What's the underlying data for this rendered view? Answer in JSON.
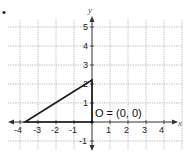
{
  "figure": {
    "bullet": "•",
    "x_axis_label": "x",
    "y_axis_label": "y",
    "x_ticks": [
      "-4",
      "-3",
      "-2",
      "-1",
      "1",
      "2",
      "3",
      "4"
    ],
    "y_ticks": [
      "5",
      "4",
      "3",
      "2",
      "1",
      "-1"
    ],
    "annotation": "O = (0, 0)",
    "triangle_vertices": [
      [
        -3.7,
        0
      ],
      [
        0,
        0
      ],
      [
        0,
        2.2
      ]
    ],
    "colors": {
      "grid": "#9a9a9a",
      "axes": "#333333",
      "triangle": "#1a1a1a"
    }
  }
}
